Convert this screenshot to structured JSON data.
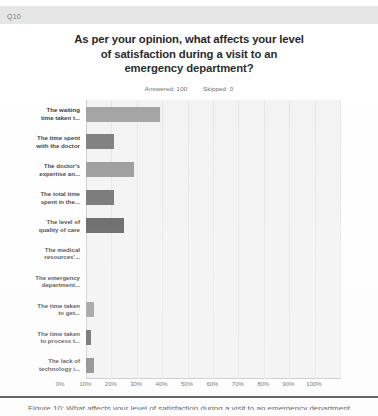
{
  "question_band": {
    "label": "Q10"
  },
  "header": {
    "title": "As per your opinion, what affects your level of satisfaction during a visit to an emergency department?",
    "title_lines": [
      "As per your opinion, what affects your level",
      "of satisfaction during a visit to an",
      "emergency department?"
    ],
    "answered_label": "Answered: 100",
    "skipped_label": "Skipped: 0"
  },
  "caption": {
    "text": "Figure 10: What affects your level of satisfaction during a visit to an emergency department"
  },
  "chart_data": {
    "type": "bar",
    "orientation": "horizontal",
    "title": "As per your opinion, what affects your level of satisfaction during a visit to an emergency department?",
    "xlabel": "",
    "ylabel": "",
    "xlim": [
      0,
      100
    ],
    "xtick_labels": [
      "0%",
      "10%",
      "20%",
      "30%",
      "40%",
      "50%",
      "60%",
      "70%",
      "80%",
      "90%",
      "100%"
    ],
    "xtick_values": [
      0,
      10,
      20,
      30,
      40,
      50,
      60,
      70,
      80,
      90,
      100
    ],
    "grid": true,
    "legend": "none",
    "unit": "percent",
    "categories": [
      "The waiting time taken t...",
      "The time spent with the doctor",
      "The doctor's expertise an...",
      "The total time spent in the...",
      "The level of quality of care",
      "The medical resources'...",
      "The emergency department...",
      "The time taken to get...",
      "The time taken to process t...",
      "The lack of technology i..."
    ],
    "category_label_lines": [
      [
        "The waiting",
        "time taken t..."
      ],
      [
        "The time spent",
        "with the doctor"
      ],
      [
        "The doctor's",
        "expertise an..."
      ],
      [
        "The total time",
        "spent in the..."
      ],
      [
        "The level of",
        "quality of care"
      ],
      [
        "The medical",
        "resources'..."
      ],
      [
        "The emergency",
        "department..."
      ],
      [
        "The time taken",
        "to get..."
      ],
      [
        "The time taken",
        "to process t..."
      ],
      [
        "The lack of",
        "technology i..."
      ]
    ],
    "values": [
      29,
      11,
      19,
      11,
      15,
      0,
      0,
      3,
      2,
      3
    ],
    "bar_colors": [
      "#9a9a9a",
      "#6e6e6e",
      "#8e8e8e",
      "#5e5e5e",
      "#4a4a4a",
      "#9a9a9a",
      "#6e6e6e",
      "#8e8e8e",
      "#4a4a4a",
      "#6e6e6e"
    ]
  },
  "colors": {
    "band": "#e6e6e6",
    "plot_background": "#f2f2f2",
    "gridline": "#e4e4e4",
    "text": "#1d1d1d"
  }
}
